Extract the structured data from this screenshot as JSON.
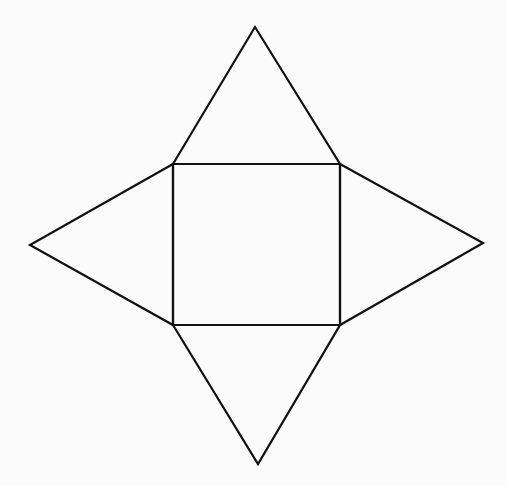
{
  "diagram": {
    "title": "",
    "type": "square-pyramid-net",
    "colors": {
      "background": "#fbfbfb",
      "stroke": "#111111"
    },
    "square": {
      "top_left": [
        173,
        164
      ],
      "top_right": [
        340,
        164
      ],
      "bottom_right": [
        340,
        325
      ],
      "bottom_left": [
        173,
        325
      ]
    },
    "triangles": [
      {
        "name": "top",
        "apex": [
          255,
          27
        ],
        "base": [
          [
            173,
            164
          ],
          [
            340,
            164
          ]
        ]
      },
      {
        "name": "left",
        "apex": [
          30,
          245
        ],
        "base": [
          [
            173,
            164
          ],
          [
            173,
            325
          ]
        ]
      },
      {
        "name": "right",
        "apex": [
          483,
          243
        ],
        "base": [
          [
            340,
            164
          ],
          [
            340,
            325
          ]
        ]
      },
      {
        "name": "bottom",
        "apex": [
          258,
          464
        ],
        "base": [
          [
            173,
            325
          ],
          [
            340,
            325
          ]
        ]
      }
    ]
  }
}
